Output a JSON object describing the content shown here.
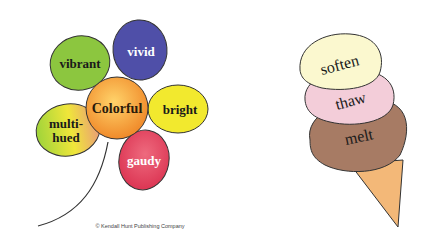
{
  "flower": {
    "center": {
      "label": "Colorful",
      "color": "#f5a23a"
    },
    "petals": [
      {
        "label": "vibrant",
        "color": "#8cc63f",
        "text_color": "#1a1a1a"
      },
      {
        "label": "vivid",
        "color": "#4f4fa8",
        "text_color": "#ffffff"
      },
      {
        "label": "bright",
        "color": "#f2e92e",
        "text_color": "#1a1a1a"
      },
      {
        "label": "gaudy",
        "color": "#e4415c",
        "text_color": "#ffffff"
      },
      {
        "label": "multi-",
        "label2": "hued",
        "color": "#d9de4a",
        "text_color": "#1a1a1a"
      }
    ]
  },
  "cone": {
    "scoops": [
      {
        "label": "soften",
        "color": "#fbf8cf"
      },
      {
        "label": "thaw",
        "color": "#f3cdd9"
      },
      {
        "label": "melt",
        "color": "#a77b64"
      }
    ],
    "cone_color": "#f3b878"
  },
  "copyright": "© Kendall Hunt Publishing Company"
}
